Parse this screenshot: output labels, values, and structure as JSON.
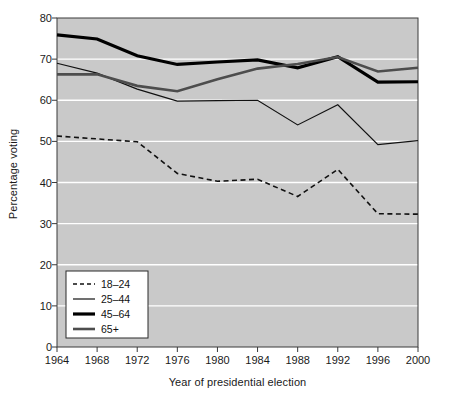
{
  "chart_data": {
    "type": "line",
    "title": "",
    "xlabel": "Year of presidential election",
    "ylabel": "Percentage voting",
    "x": [
      1964,
      1968,
      1972,
      1976,
      1980,
      1984,
      1988,
      1992,
      1996,
      2000
    ],
    "xticklabels": [
      "1964",
      "1968",
      "1972",
      "1976",
      "1980",
      "1984",
      "1988",
      "1992",
      "1996",
      "2000"
    ],
    "yticks": [
      0,
      10,
      20,
      30,
      40,
      50,
      60,
      70,
      80
    ],
    "yticklabels": [
      "0",
      "10",
      "20",
      "30",
      "40",
      "50",
      "60",
      "70",
      "80"
    ],
    "ylim": [
      0,
      80
    ],
    "xlim": [
      1964,
      2000
    ],
    "grid": "horizontal-white-gridlines",
    "plot_background": "#c9c9c9",
    "figure_background": "#ffffff",
    "legend_position": "lower-left-inside",
    "series": [
      {
        "name": "18–24",
        "style": "dashed",
        "color": "#111111",
        "width": 1.6,
        "values": [
          51.3,
          50.6,
          49.9,
          42.2,
          40.3,
          40.8,
          36.6,
          43.2,
          32.4,
          32.3
        ]
      },
      {
        "name": "25–44",
        "style": "solid-thin",
        "color": "#111111",
        "width": 1.2,
        "values": [
          69.0,
          66.6,
          62.7,
          59.8,
          59.9,
          60.0,
          54.0,
          58.9,
          49.2,
          50.2
        ]
      },
      {
        "name": "45–64",
        "style": "solid-thick",
        "color": "#000000",
        "width": 3.2,
        "values": [
          75.9,
          74.9,
          70.8,
          68.7,
          69.3,
          69.8,
          67.9,
          70.6,
          64.4,
          64.5
        ]
      },
      {
        "name": "65+",
        "style": "solid-medium",
        "color": "#4d4d4d",
        "width": 2.6,
        "values": [
          66.3,
          66.3,
          63.5,
          62.2,
          65.1,
          67.7,
          68.8,
          70.5,
          67.0,
          67.9
        ]
      }
    ]
  },
  "legend": {
    "entries": [
      {
        "label": "18–24",
        "swatch": "dashed-thin-black"
      },
      {
        "label": "25–44",
        "swatch": "solid-thin-black"
      },
      {
        "label": "45–64",
        "swatch": "solid-thick-black"
      },
      {
        "label": "65+",
        "swatch": "solid-medium-gray"
      }
    ]
  }
}
